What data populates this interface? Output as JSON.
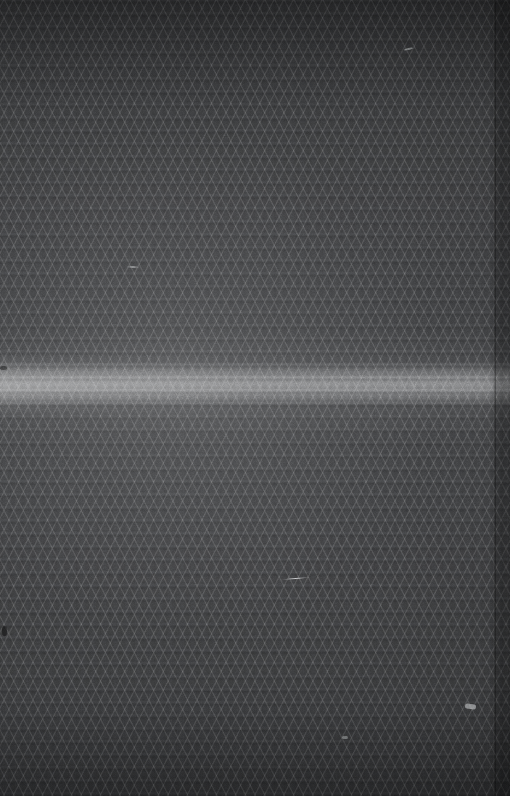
{
  "image": {
    "kind": "macro-photograph",
    "subject": "knitted fabric surface",
    "width_px": 510,
    "height_px": 796,
    "caption": "Close-up macro photograph of dark grey knitted fabric with a repeating diamond-lattice mesh and horizontal rib courses; a bright specular light band crosses the upper-middle and a folded edge runs down the right side.",
    "alt_text": "Dark grey textile texture filling the whole frame"
  },
  "palette": {
    "base_cloth": "#3c3d3f",
    "deep_shadow": "#2a2b2d",
    "mid_tone": "#4a4b4d",
    "highlight_band": "#8a8b8d",
    "yarn_sheen": "#9a9b9d",
    "fold_shadow": "#252627",
    "lint_white": "#eceef0"
  },
  "structure": {
    "weave_type": "diamond lattice knit",
    "rib_course_spacing_px": 13,
    "lattice_cell_width_px": 11,
    "lattice_angle_deg": 63,
    "wale_spacing_px": 4,
    "orientation": "horizontal courses"
  },
  "lighting": {
    "specular_band_top_px": 362,
    "specular_band_bottom_px": 406,
    "specular_band_peak_px": 384,
    "brightest_side": "left",
    "vignette": "corners darkened",
    "top_shade_px": 110,
    "bottom_shade_px": 90
  },
  "features": {
    "right_fold": {
      "name": "folded selvedge edge",
      "x_start_px": 488,
      "width_px": 22,
      "tone": "darker than field"
    },
    "lint": [
      {
        "name": "long lint fibre",
        "x_px": 281,
        "y_px": 578,
        "length_px": 29
      },
      {
        "name": "lint fleck",
        "x_px": 465,
        "y_px": 704,
        "length_px": 11
      },
      {
        "name": "lint fleck",
        "x_px": 404,
        "y_px": 48,
        "length_px": 9
      },
      {
        "name": "lint fibre",
        "x_px": 126,
        "y_px": 266,
        "length_px": 14
      },
      {
        "name": "lint fleck",
        "x_px": 342,
        "y_px": 736,
        "length_px": 6
      }
    ],
    "slubs": [
      {
        "name": "yarn slub",
        "x_px": 0,
        "y_px": 366
      },
      {
        "name": "yarn slub",
        "x_px": 2,
        "y_px": 626
      }
    ]
  },
  "grain": {
    "type": "sensor-noise",
    "opacity": 0.3,
    "frequency": 0.85
  }
}
